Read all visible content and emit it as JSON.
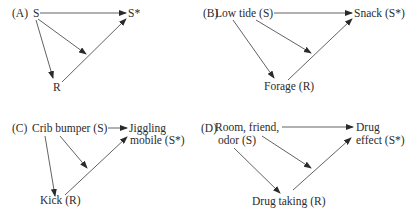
{
  "panels": [
    {
      "id": "A",
      "label": "(A)",
      "stimulus": "S",
      "outcome": "S*",
      "response": "R"
    },
    {
      "id": "B",
      "label": "(B)",
      "stimulus": "Low tide (S)",
      "outcome": "Snack (S*)",
      "response": "Forage (R)"
    },
    {
      "id": "C",
      "label": "(C)",
      "stimulus": "Crib bumper (S)",
      "outcome_line1": "Jiggling",
      "outcome_line2": "mobile (S*)",
      "response": "Kick (R)"
    },
    {
      "id": "D",
      "label": "(D)",
      "stimulus_line1": "Room, friend,",
      "stimulus_line2": "odor (S)",
      "outcome_line1": "Drug",
      "outcome_line2": "effect (S*)",
      "response": "Drug taking (R)"
    }
  ],
  "colors": {
    "line": "#3a3a3a",
    "text": "#2b2b2b",
    "background": "#ffffff"
  }
}
